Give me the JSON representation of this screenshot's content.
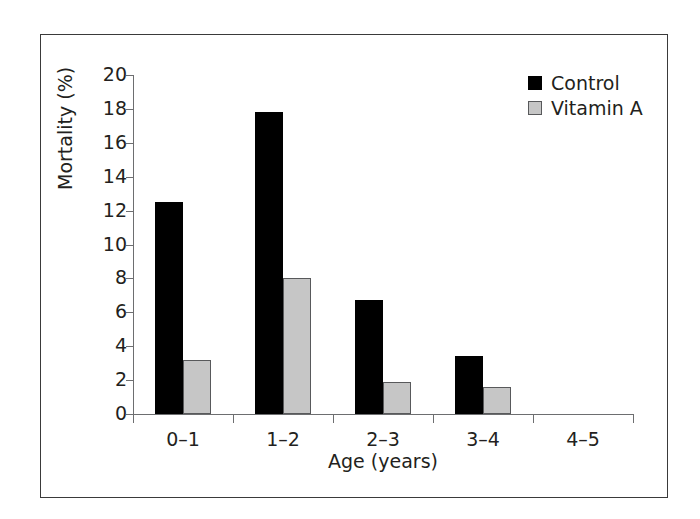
{
  "chart_data": {
    "type": "bar",
    "title": "",
    "subtitle": "",
    "xlabel": "Age (years)",
    "ylabel": "Mortality (%)",
    "categories": [
      "0–1",
      "1–2",
      "2–3",
      "3–4",
      "4–5"
    ],
    "series": [
      {
        "name": "Control",
        "color": "#000000",
        "values": [
          12.5,
          17.8,
          6.7,
          3.4,
          0
        ]
      },
      {
        "name": "Vitamin A",
        "color": "#c6c6c6",
        "values": [
          3.2,
          8.0,
          1.9,
          1.6,
          0
        ]
      }
    ],
    "ylim": [
      0,
      20
    ],
    "y_ticks": [
      0,
      2,
      4,
      6,
      8,
      10,
      12,
      14,
      16,
      18,
      20
    ],
    "y_tick_labels": [
      "0",
      "2",
      "4",
      "6",
      "8",
      "10",
      "12",
      "14",
      "16",
      "18",
      "20"
    ],
    "grid": false,
    "legend_position": "top-right",
    "legend": [
      {
        "label": "Control",
        "swatch": "filled-black-square"
      },
      {
        "label": "Vitamin A",
        "swatch": "filled-gray-square"
      }
    ],
    "annotations": []
  },
  "colors": {
    "control": "#000000",
    "vitamin_a": "#c6c6c6",
    "vitamin_a_border": "#58595b",
    "axis": "#6d6e70",
    "text": "#231f20",
    "frame": "#3a3a3a",
    "background": "#ffffff"
  }
}
